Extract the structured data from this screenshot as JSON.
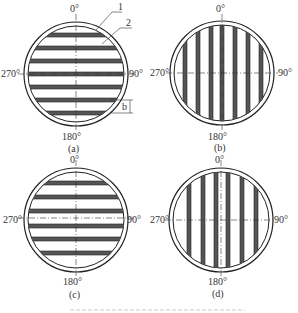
{
  "panels": [
    {
      "id": "a",
      "caption": "(a)",
      "top": "0°",
      "right": "90°",
      "bottom": "180°",
      "left": "270°",
      "orientation": "horizontal",
      "callouts": [
        "1",
        "2"
      ],
      "dimension": "b"
    },
    {
      "id": "b",
      "caption": "(b)",
      "top": "0°",
      "right": "90°",
      "bottom": "180°",
      "left": "270°",
      "orientation": "vertical"
    },
    {
      "id": "c",
      "caption": "(c)",
      "top": "0°",
      "right": "90°",
      "bottom": "180°",
      "left": "270°",
      "orientation": "horizontal"
    },
    {
      "id": "d",
      "caption": "(d)",
      "top": "0°",
      "right": "90°",
      "bottom": "180°",
      "left": "270°",
      "orientation": "vertical"
    }
  ]
}
